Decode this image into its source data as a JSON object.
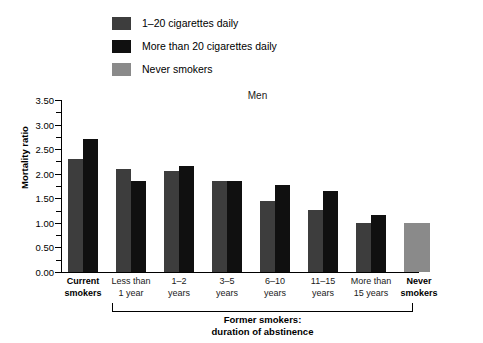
{
  "legend": {
    "items": [
      {
        "label": "1–20 cigarettes daily",
        "color": "#3d3d3d"
      },
      {
        "label": "More than 20 cigarettes daily",
        "color": "#101010"
      },
      {
        "label": "Never smokers",
        "color": "#8a8a8a"
      }
    ]
  },
  "annotations": {
    "bracket_caption_line1": "Former smokers:",
    "bracket_caption_line2": "duration of abstinence"
  },
  "chart_data": {
    "type": "bar",
    "title": "Men",
    "xlabel": "",
    "ylabel": "Mortality ratio",
    "ylim": [
      0.0,
      3.5
    ],
    "ytick_labels": [
      "0.00",
      "0.50",
      "1.00",
      "1.50",
      "2.00",
      "2.50",
      "3.00",
      "3.50"
    ],
    "ytick_values": [
      0.0,
      0.5,
      1.0,
      1.5,
      2.0,
      2.5,
      3.0,
      3.5
    ],
    "minor_tick_step": 0.25,
    "grid": false,
    "legend_position": "top-left",
    "categories": [
      "Current\nsmokers",
      "Less than\n1 year",
      "1–2\nyears",
      "3–5\nyears",
      "6–10\nyears",
      "11–15\nyears",
      "More than\n15 years",
      "Never\nsmokers"
    ],
    "category_labels": [
      {
        "line1": "Current",
        "line2": "smokers",
        "bold": true
      },
      {
        "line1": "Less than",
        "line2": "1 year",
        "bold": false
      },
      {
        "line1": "1–2",
        "line2": "years",
        "bold": false
      },
      {
        "line1": "3–5",
        "line2": "years",
        "bold": false
      },
      {
        "line1": "6–10",
        "line2": "years",
        "bold": false
      },
      {
        "line1": "11–15",
        "line2": "years",
        "bold": false
      },
      {
        "line1": "More than",
        "line2": "15 years",
        "bold": false
      },
      {
        "line1": "Never",
        "line2": "smokers",
        "bold": true
      }
    ],
    "series": [
      {
        "name": "1–20 cigarettes daily",
        "color": "#3d3d3d",
        "values": [
          2.3,
          2.1,
          2.05,
          1.85,
          1.45,
          1.27,
          1.0,
          null
        ]
      },
      {
        "name": "More than 20 cigarettes daily",
        "color": "#101010",
        "values": [
          2.7,
          1.85,
          2.15,
          1.85,
          1.77,
          1.65,
          1.17,
          null
        ]
      },
      {
        "name": "Never smokers",
        "color": "#8a8a8a",
        "values": [
          null,
          null,
          null,
          null,
          null,
          null,
          null,
          1.0
        ]
      }
    ]
  }
}
